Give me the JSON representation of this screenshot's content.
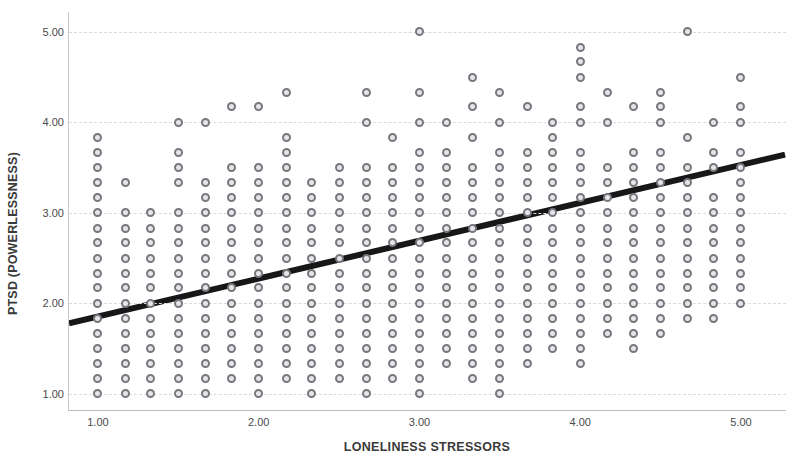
{
  "chart_data": {
    "type": "scatter",
    "title": "",
    "xlabel": "LONELINESS STRESSORS",
    "ylabel": "PTSD (POWERLESSNESS)",
    "xlim": [
      0.82,
      5.28
    ],
    "ylim": [
      0.82,
      5.22
    ],
    "xticks": [
      "1.00",
      "2.00",
      "3.00",
      "4.00",
      "5.00"
    ],
    "xtick_values": [
      1,
      2,
      3,
      4,
      5
    ],
    "yticks": [
      "5.00",
      "4.00",
      "3.00",
      "2.00",
      "1.00"
    ],
    "ytick_values": [
      5,
      4,
      3,
      2,
      1
    ],
    "grid": "horizontal-dashed",
    "legend": "none",
    "marker": {
      "shape": "circle-open",
      "edge_color": "#77777d",
      "fill_color": "#e6e6ea",
      "size": 9
    },
    "fit_line": {
      "type": "linear",
      "color": "#171717",
      "width": 6,
      "x_start": 0.82,
      "y_start": 1.77,
      "x_end": 5.28,
      "y_end": 3.64
    },
    "points": [
      [
        1.0,
        1.0
      ],
      [
        1.0,
        1.17
      ],
      [
        1.0,
        1.33
      ],
      [
        1.0,
        1.5
      ],
      [
        1.0,
        1.67
      ],
      [
        1.0,
        1.83
      ],
      [
        1.0,
        2.0
      ],
      [
        1.0,
        2.17
      ],
      [
        1.0,
        2.33
      ],
      [
        1.0,
        2.5
      ],
      [
        1.0,
        2.67
      ],
      [
        1.0,
        2.83
      ],
      [
        1.0,
        3.0
      ],
      [
        1.0,
        3.17
      ],
      [
        1.0,
        3.33
      ],
      [
        1.0,
        3.5
      ],
      [
        1.0,
        3.67
      ],
      [
        1.0,
        3.83
      ],
      [
        1.17,
        1.0
      ],
      [
        1.17,
        1.17
      ],
      [
        1.17,
        1.33
      ],
      [
        1.17,
        1.5
      ],
      [
        1.17,
        1.67
      ],
      [
        1.17,
        1.83
      ],
      [
        1.17,
        2.0
      ],
      [
        1.17,
        2.17
      ],
      [
        1.17,
        2.33
      ],
      [
        1.17,
        2.5
      ],
      [
        1.17,
        2.67
      ],
      [
        1.17,
        2.83
      ],
      [
        1.17,
        3.0
      ],
      [
        1.17,
        3.33
      ],
      [
        1.33,
        1.0
      ],
      [
        1.33,
        1.17
      ],
      [
        1.33,
        1.33
      ],
      [
        1.33,
        1.5
      ],
      [
        1.33,
        1.67
      ],
      [
        1.33,
        1.83
      ],
      [
        1.33,
        2.0
      ],
      [
        1.33,
        2.17
      ],
      [
        1.33,
        2.33
      ],
      [
        1.33,
        2.5
      ],
      [
        1.33,
        2.67
      ],
      [
        1.33,
        2.83
      ],
      [
        1.33,
        3.0
      ],
      [
        1.5,
        1.0
      ],
      [
        1.5,
        1.17
      ],
      [
        1.5,
        1.33
      ],
      [
        1.5,
        1.5
      ],
      [
        1.5,
        1.67
      ],
      [
        1.5,
        1.83
      ],
      [
        1.5,
        2.0
      ],
      [
        1.5,
        2.17
      ],
      [
        1.5,
        2.33
      ],
      [
        1.5,
        2.5
      ],
      [
        1.5,
        2.67
      ],
      [
        1.5,
        2.83
      ],
      [
        1.5,
        3.0
      ],
      [
        1.5,
        3.33
      ],
      [
        1.5,
        3.5
      ],
      [
        1.5,
        3.67
      ],
      [
        1.5,
        4.0
      ],
      [
        1.67,
        1.0
      ],
      [
        1.67,
        1.17
      ],
      [
        1.67,
        1.33
      ],
      [
        1.67,
        1.5
      ],
      [
        1.67,
        1.67
      ],
      [
        1.67,
        1.83
      ],
      [
        1.67,
        2.0
      ],
      [
        1.67,
        2.17
      ],
      [
        1.67,
        2.33
      ],
      [
        1.67,
        2.5
      ],
      [
        1.67,
        2.67
      ],
      [
        1.67,
        2.83
      ],
      [
        1.67,
        3.0
      ],
      [
        1.67,
        3.17
      ],
      [
        1.67,
        3.33
      ],
      [
        1.67,
        4.0
      ],
      [
        1.83,
        1.17
      ],
      [
        1.83,
        1.33
      ],
      [
        1.83,
        1.5
      ],
      [
        1.83,
        1.67
      ],
      [
        1.83,
        1.83
      ],
      [
        1.83,
        2.0
      ],
      [
        1.83,
        2.17
      ],
      [
        1.83,
        2.33
      ],
      [
        1.83,
        2.5
      ],
      [
        1.83,
        2.67
      ],
      [
        1.83,
        2.83
      ],
      [
        1.83,
        3.0
      ],
      [
        1.83,
        3.17
      ],
      [
        1.83,
        3.33
      ],
      [
        1.83,
        3.5
      ],
      [
        1.83,
        4.17
      ],
      [
        2.0,
        1.0
      ],
      [
        2.0,
        1.17
      ],
      [
        2.0,
        1.33
      ],
      [
        2.0,
        1.5
      ],
      [
        2.0,
        1.67
      ],
      [
        2.0,
        1.83
      ],
      [
        2.0,
        2.0
      ],
      [
        2.0,
        2.17
      ],
      [
        2.0,
        2.33
      ],
      [
        2.0,
        2.5
      ],
      [
        2.0,
        2.67
      ],
      [
        2.0,
        2.83
      ],
      [
        2.0,
        3.0
      ],
      [
        2.0,
        3.17
      ],
      [
        2.0,
        3.33
      ],
      [
        2.0,
        3.5
      ],
      [
        2.0,
        4.17
      ],
      [
        2.17,
        1.17
      ],
      [
        2.17,
        1.33
      ],
      [
        2.17,
        1.5
      ],
      [
        2.17,
        1.67
      ],
      [
        2.17,
        1.83
      ],
      [
        2.17,
        2.0
      ],
      [
        2.17,
        2.17
      ],
      [
        2.17,
        2.33
      ],
      [
        2.17,
        2.5
      ],
      [
        2.17,
        2.67
      ],
      [
        2.17,
        2.83
      ],
      [
        2.17,
        3.0
      ],
      [
        2.17,
        3.17
      ],
      [
        2.17,
        3.33
      ],
      [
        2.17,
        3.5
      ],
      [
        2.17,
        3.67
      ],
      [
        2.17,
        3.83
      ],
      [
        2.17,
        4.33
      ],
      [
        2.33,
        1.0
      ],
      [
        2.33,
        1.17
      ],
      [
        2.33,
        1.33
      ],
      [
        2.33,
        1.5
      ],
      [
        2.33,
        1.67
      ],
      [
        2.33,
        1.83
      ],
      [
        2.33,
        2.0
      ],
      [
        2.33,
        2.17
      ],
      [
        2.33,
        2.33
      ],
      [
        2.33,
        2.5
      ],
      [
        2.33,
        2.67
      ],
      [
        2.33,
        2.83
      ],
      [
        2.33,
        3.0
      ],
      [
        2.33,
        3.17
      ],
      [
        2.33,
        3.33
      ],
      [
        2.5,
        1.17
      ],
      [
        2.5,
        1.33
      ],
      [
        2.5,
        1.5
      ],
      [
        2.5,
        1.67
      ],
      [
        2.5,
        1.83
      ],
      [
        2.5,
        2.0
      ],
      [
        2.5,
        2.17
      ],
      [
        2.5,
        2.33
      ],
      [
        2.5,
        2.5
      ],
      [
        2.5,
        2.67
      ],
      [
        2.5,
        2.83
      ],
      [
        2.5,
        3.0
      ],
      [
        2.5,
        3.17
      ],
      [
        2.5,
        3.33
      ],
      [
        2.5,
        3.5
      ],
      [
        2.67,
        1.0
      ],
      [
        2.67,
        1.17
      ],
      [
        2.67,
        1.33
      ],
      [
        2.67,
        1.5
      ],
      [
        2.67,
        1.67
      ],
      [
        2.67,
        1.83
      ],
      [
        2.67,
        2.0
      ],
      [
        2.67,
        2.17
      ],
      [
        2.67,
        2.33
      ],
      [
        2.67,
        2.5
      ],
      [
        2.67,
        2.67
      ],
      [
        2.67,
        2.83
      ],
      [
        2.67,
        3.0
      ],
      [
        2.67,
        3.17
      ],
      [
        2.67,
        3.33
      ],
      [
        2.67,
        3.5
      ],
      [
        2.67,
        4.0
      ],
      [
        2.67,
        4.33
      ],
      [
        2.83,
        1.17
      ],
      [
        2.83,
        1.33
      ],
      [
        2.83,
        1.5
      ],
      [
        2.83,
        1.67
      ],
      [
        2.83,
        1.83
      ],
      [
        2.83,
        2.0
      ],
      [
        2.83,
        2.17
      ],
      [
        2.83,
        2.33
      ],
      [
        2.83,
        2.5
      ],
      [
        2.83,
        2.67
      ],
      [
        2.83,
        2.83
      ],
      [
        2.83,
        3.0
      ],
      [
        2.83,
        3.17
      ],
      [
        2.83,
        3.33
      ],
      [
        2.83,
        3.5
      ],
      [
        2.83,
        3.83
      ],
      [
        3.0,
        1.0
      ],
      [
        3.0,
        1.17
      ],
      [
        3.0,
        1.33
      ],
      [
        3.0,
        1.5
      ],
      [
        3.0,
        1.67
      ],
      [
        3.0,
        1.83
      ],
      [
        3.0,
        2.0
      ],
      [
        3.0,
        2.17
      ],
      [
        3.0,
        2.33
      ],
      [
        3.0,
        2.5
      ],
      [
        3.0,
        2.67
      ],
      [
        3.0,
        2.83
      ],
      [
        3.0,
        3.0
      ],
      [
        3.0,
        3.17
      ],
      [
        3.0,
        3.33
      ],
      [
        3.0,
        3.5
      ],
      [
        3.0,
        3.67
      ],
      [
        3.0,
        4.0
      ],
      [
        3.0,
        4.33
      ],
      [
        3.0,
        5.0
      ],
      [
        3.17,
        1.33
      ],
      [
        3.17,
        1.5
      ],
      [
        3.17,
        1.67
      ],
      [
        3.17,
        1.83
      ],
      [
        3.17,
        2.0
      ],
      [
        3.17,
        2.17
      ],
      [
        3.17,
        2.33
      ],
      [
        3.17,
        2.5
      ],
      [
        3.17,
        2.67
      ],
      [
        3.17,
        2.83
      ],
      [
        3.17,
        3.0
      ],
      [
        3.17,
        3.17
      ],
      [
        3.17,
        3.33
      ],
      [
        3.17,
        3.5
      ],
      [
        3.17,
        3.67
      ],
      [
        3.17,
        4.0
      ],
      [
        3.33,
        1.17
      ],
      [
        3.33,
        1.33
      ],
      [
        3.33,
        1.5
      ],
      [
        3.33,
        1.67
      ],
      [
        3.33,
        1.83
      ],
      [
        3.33,
        2.0
      ],
      [
        3.33,
        2.17
      ],
      [
        3.33,
        2.33
      ],
      [
        3.33,
        2.5
      ],
      [
        3.33,
        2.67
      ],
      [
        3.33,
        2.83
      ],
      [
        3.33,
        3.0
      ],
      [
        3.33,
        3.17
      ],
      [
        3.33,
        3.33
      ],
      [
        3.33,
        3.5
      ],
      [
        3.33,
        3.83
      ],
      [
        3.33,
        4.17
      ],
      [
        3.33,
        4.5
      ],
      [
        3.5,
        1.0
      ],
      [
        3.5,
        1.17
      ],
      [
        3.5,
        1.33
      ],
      [
        3.5,
        1.5
      ],
      [
        3.5,
        1.67
      ],
      [
        3.5,
        1.83
      ],
      [
        3.5,
        2.0
      ],
      [
        3.5,
        2.17
      ],
      [
        3.5,
        2.33
      ],
      [
        3.5,
        2.5
      ],
      [
        3.5,
        2.67
      ],
      [
        3.5,
        2.83
      ],
      [
        3.5,
        3.0
      ],
      [
        3.5,
        3.17
      ],
      [
        3.5,
        3.33
      ],
      [
        3.5,
        3.5
      ],
      [
        3.5,
        3.67
      ],
      [
        3.5,
        4.0
      ],
      [
        3.5,
        4.33
      ],
      [
        3.67,
        1.33
      ],
      [
        3.67,
        1.5
      ],
      [
        3.67,
        1.67
      ],
      [
        3.67,
        1.83
      ],
      [
        3.67,
        2.0
      ],
      [
        3.67,
        2.17
      ],
      [
        3.67,
        2.33
      ],
      [
        3.67,
        2.5
      ],
      [
        3.67,
        2.67
      ],
      [
        3.67,
        2.83
      ],
      [
        3.67,
        3.0
      ],
      [
        3.67,
        3.17
      ],
      [
        3.67,
        3.33
      ],
      [
        3.67,
        3.5
      ],
      [
        3.67,
        3.67
      ],
      [
        3.67,
        4.17
      ],
      [
        3.83,
        1.5
      ],
      [
        3.83,
        1.67
      ],
      [
        3.83,
        1.83
      ],
      [
        3.83,
        2.0
      ],
      [
        3.83,
        2.17
      ],
      [
        3.83,
        2.33
      ],
      [
        3.83,
        2.5
      ],
      [
        3.83,
        2.67
      ],
      [
        3.83,
        2.83
      ],
      [
        3.83,
        3.0
      ],
      [
        3.83,
        3.17
      ],
      [
        3.83,
        3.33
      ],
      [
        3.83,
        3.5
      ],
      [
        3.83,
        3.67
      ],
      [
        3.83,
        3.83
      ],
      [
        3.83,
        4.0
      ],
      [
        4.0,
        1.33
      ],
      [
        4.0,
        1.5
      ],
      [
        4.0,
        1.67
      ],
      [
        4.0,
        1.83
      ],
      [
        4.0,
        2.0
      ],
      [
        4.0,
        2.17
      ],
      [
        4.0,
        2.33
      ],
      [
        4.0,
        2.5
      ],
      [
        4.0,
        2.67
      ],
      [
        4.0,
        2.83
      ],
      [
        4.0,
        3.0
      ],
      [
        4.0,
        3.17
      ],
      [
        4.0,
        3.33
      ],
      [
        4.0,
        3.5
      ],
      [
        4.0,
        3.67
      ],
      [
        4.0,
        4.0
      ],
      [
        4.0,
        4.17
      ],
      [
        4.0,
        4.5
      ],
      [
        4.0,
        4.67
      ],
      [
        4.0,
        4.83
      ],
      [
        4.17,
        1.67
      ],
      [
        4.17,
        1.83
      ],
      [
        4.17,
        2.0
      ],
      [
        4.17,
        2.17
      ],
      [
        4.17,
        2.33
      ],
      [
        4.17,
        2.5
      ],
      [
        4.17,
        2.67
      ],
      [
        4.17,
        2.83
      ],
      [
        4.17,
        3.0
      ],
      [
        4.17,
        3.17
      ],
      [
        4.17,
        3.33
      ],
      [
        4.17,
        3.5
      ],
      [
        4.17,
        4.0
      ],
      [
        4.17,
        4.33
      ],
      [
        4.33,
        1.5
      ],
      [
        4.33,
        1.67
      ],
      [
        4.33,
        1.83
      ],
      [
        4.33,
        2.0
      ],
      [
        4.33,
        2.17
      ],
      [
        4.33,
        2.33
      ],
      [
        4.33,
        2.5
      ],
      [
        4.33,
        2.67
      ],
      [
        4.33,
        2.83
      ],
      [
        4.33,
        3.0
      ],
      [
        4.33,
        3.17
      ],
      [
        4.33,
        3.33
      ],
      [
        4.33,
        3.5
      ],
      [
        4.33,
        3.67
      ],
      [
        4.33,
        4.17
      ],
      [
        4.5,
        1.67
      ],
      [
        4.5,
        1.83
      ],
      [
        4.5,
        2.0
      ],
      [
        4.5,
        2.17
      ],
      [
        4.5,
        2.33
      ],
      [
        4.5,
        2.5
      ],
      [
        4.5,
        2.67
      ],
      [
        4.5,
        2.83
      ],
      [
        4.5,
        3.0
      ],
      [
        4.5,
        3.17
      ],
      [
        4.5,
        3.33
      ],
      [
        4.5,
        3.5
      ],
      [
        4.5,
        3.67
      ],
      [
        4.5,
        4.0
      ],
      [
        4.5,
        4.17
      ],
      [
        4.5,
        4.33
      ],
      [
        4.67,
        1.83
      ],
      [
        4.67,
        2.0
      ],
      [
        4.67,
        2.17
      ],
      [
        4.67,
        2.33
      ],
      [
        4.67,
        2.5
      ],
      [
        4.67,
        2.67
      ],
      [
        4.67,
        2.83
      ],
      [
        4.67,
        3.0
      ],
      [
        4.67,
        3.17
      ],
      [
        4.67,
        3.33
      ],
      [
        4.67,
        3.5
      ],
      [
        4.67,
        3.83
      ],
      [
        4.67,
        5.0
      ],
      [
        4.83,
        1.83
      ],
      [
        4.83,
        2.0
      ],
      [
        4.83,
        2.17
      ],
      [
        4.83,
        2.33
      ],
      [
        4.83,
        2.5
      ],
      [
        4.83,
        2.67
      ],
      [
        4.83,
        2.83
      ],
      [
        4.83,
        3.0
      ],
      [
        4.83,
        3.17
      ],
      [
        4.83,
        3.5
      ],
      [
        4.83,
        3.67
      ],
      [
        4.83,
        4.0
      ],
      [
        5.0,
        2.0
      ],
      [
        5.0,
        2.17
      ],
      [
        5.0,
        2.33
      ],
      [
        5.0,
        2.5
      ],
      [
        5.0,
        2.67
      ],
      [
        5.0,
        2.83
      ],
      [
        5.0,
        3.0
      ],
      [
        5.0,
        3.17
      ],
      [
        5.0,
        3.33
      ],
      [
        5.0,
        3.5
      ],
      [
        5.0,
        3.67
      ],
      [
        5.0,
        4.0
      ],
      [
        5.0,
        4.17
      ],
      [
        5.0,
        4.5
      ]
    ]
  }
}
